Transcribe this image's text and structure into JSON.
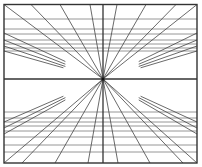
{
  "diagram": {
    "type": "one-point-perspective",
    "frame": {
      "x1": 4,
      "y1": 4.5,
      "x2": 197,
      "y2": 163,
      "color": "#333333"
    },
    "vanishing_point": {
      "x": 103,
      "y": 79
    },
    "horizon_y": 79,
    "line_color": "#444444",
    "frame_color": "#333333",
    "horizontals_top": [
      19,
      29,
      34,
      40,
      44,
      48,
      51
    ],
    "horizontals_bottom": [
      112,
      118,
      122,
      126,
      131,
      137,
      145,
      152
    ],
    "radials_full": [
      {
        "x": 4,
        "y": 4.5
      },
      {
        "x": 31,
        "y": 4.5
      },
      {
        "x": 60,
        "y": 4.5
      },
      {
        "x": 90,
        "y": 4.5
      },
      {
        "x": 117,
        "y": 4.5
      },
      {
        "x": 146,
        "y": 4.5
      },
      {
        "x": 176,
        "y": 4.5
      },
      {
        "x": 197,
        "y": 4.5
      },
      {
        "x": 22,
        "y": 163
      },
      {
        "x": 55,
        "y": 163
      },
      {
        "x": 88,
        "y": 163
      },
      {
        "x": 118,
        "y": 163
      },
      {
        "x": 150,
        "y": 163
      },
      {
        "x": 183,
        "y": 163
      },
      {
        "x": 4,
        "y": 163
      },
      {
        "x": 197,
        "y": 163
      }
    ],
    "radials_partial": [
      {
        "x1": 4,
        "y1": 33,
        "t": 0.62
      },
      {
        "x1": 4,
        "y1": 40,
        "t": 0.62
      },
      {
        "x1": 4,
        "y1": 46,
        "t": 0.62
      },
      {
        "x1": 4,
        "y1": 51,
        "t": 0.6
      },
      {
        "x1": 197,
        "y1": 33,
        "t": 0.62
      },
      {
        "x1": 197,
        "y1": 40,
        "t": 0.62
      },
      {
        "x1": 197,
        "y1": 46,
        "t": 0.62
      },
      {
        "x1": 197,
        "y1": 51,
        "t": 0.6
      },
      {
        "x1": 4,
        "y1": 122,
        "t": 0.6
      },
      {
        "x1": 4,
        "y1": 128,
        "t": 0.62
      },
      {
        "x1": 4,
        "y1": 134,
        "t": 0.62
      },
      {
        "x1": 197,
        "y1": 122,
        "t": 0.6
      },
      {
        "x1": 197,
        "y1": 128,
        "t": 0.62
      },
      {
        "x1": 197,
        "y1": 134,
        "t": 0.62
      }
    ]
  }
}
